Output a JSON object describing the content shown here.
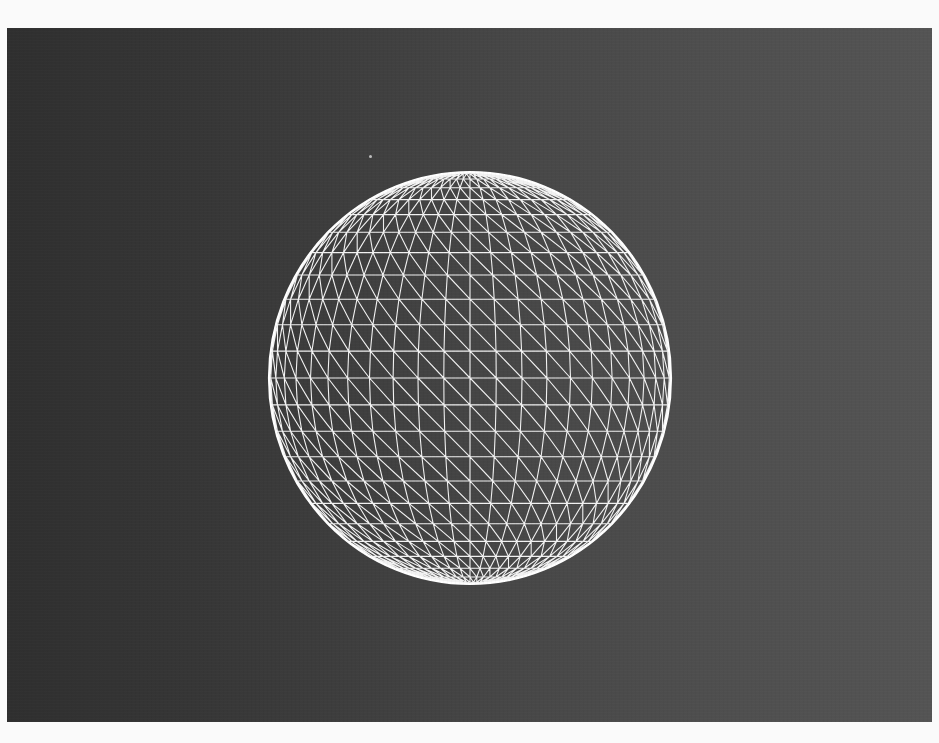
{
  "viewport": {
    "background_left": "#2f2f2f",
    "background_right": "#545454",
    "frame_color": "#fafafa"
  },
  "sphere": {
    "type": "uv-sphere-wireframe",
    "projection": "orthographic",
    "center_x": 463,
    "center_y": 350,
    "radius_x": 201,
    "radius_y": 206,
    "latitude_segments": 24,
    "longitude_segments": 48,
    "diagonal_direction": "top-left-to-bottom-right",
    "line_color": "#f2f2f2",
    "rim_color": "#ffffff"
  },
  "artifacts": {
    "speck": {
      "x": 362,
      "y": 127
    }
  }
}
